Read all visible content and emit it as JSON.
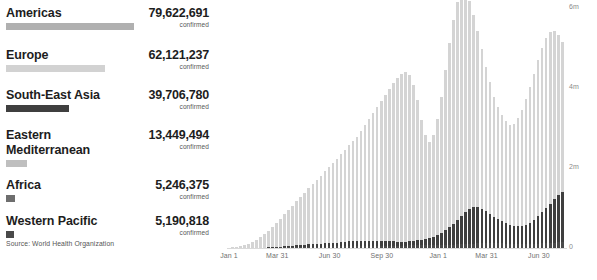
{
  "legend": {
    "confirmed_label": "confirmed",
    "items": [
      {
        "name": "Americas",
        "value": "79,622,691",
        "bar_width": 128,
        "color": "#b0b0b0",
        "swatch": "bar"
      },
      {
        "name": "Europe",
        "value": "62,121,237",
        "bar_width": 99,
        "color": "#d2d2d2",
        "swatch": "bar"
      },
      {
        "name": "South-East Asia",
        "value": "39,706,780",
        "bar_width": 63,
        "color": "#3f3f3f",
        "swatch": "bar"
      },
      {
        "name": "Eastern Mediterranean",
        "value": "13,449,494",
        "bar_width": 21,
        "color": "#bfbfbf",
        "swatch": "bar"
      },
      {
        "name": "Africa",
        "value": "5,246,375",
        "bar_width": 9,
        "color": "#6e6e6e",
        "swatch": "square"
      },
      {
        "name": "Western Pacific",
        "value": "5,190,818",
        "bar_width": 8,
        "color": "#4a4a4a",
        "swatch": "square"
      }
    ]
  },
  "source": "Source: World Health Organization",
  "chart_data": {
    "type": "bar",
    "stacked": true,
    "title": "",
    "xlabel": "",
    "ylabel": "",
    "ylim": [
      0,
      6000000
    ],
    "grid": false,
    "legend_position": "left-panel",
    "ytick_labels": [
      "6m",
      "4m",
      "2m",
      "0"
    ],
    "ytick_values": [
      6000000,
      4000000,
      2000000,
      0
    ],
    "xtick_labels": [
      "Jan 1",
      "Mar 31",
      "Jun 30",
      "Sep 30",
      "Jan 1",
      "Mar 31",
      "Jun 30"
    ],
    "xtick_indices": [
      0,
      12,
      25,
      38,
      52,
      64,
      77
    ],
    "series": [
      {
        "name": "bottom-dark",
        "color": "#4a4a4a",
        "values": [
          0,
          0,
          0,
          0,
          0,
          0,
          0,
          2,
          4,
          6,
          8,
          10,
          12,
          14,
          16,
          18,
          20,
          22,
          24,
          26,
          28,
          30,
          32,
          34,
          36,
          38,
          40,
          42,
          44,
          46,
          48,
          48,
          48,
          46,
          46,
          46,
          46,
          48,
          50,
          52,
          54,
          56,
          58,
          60,
          62,
          64,
          66,
          68,
          70,
          72,
          74,
          76,
          78,
          80,
          82,
          84,
          86,
          90,
          95,
          100,
          105,
          110,
          115,
          120,
          125,
          130,
          128,
          124,
          118,
          112,
          106,
          100,
          96,
          92,
          90,
          95,
          100,
          108,
          116,
          124,
          130,
          136,
          142,
          148
        ]
      },
      {
        "name": "mid-dark",
        "color": "#3f3f3f",
        "values": [
          0,
          0,
          0,
          0,
          0,
          0,
          0,
          0,
          2,
          4,
          8,
          12,
          16,
          22,
          28,
          34,
          40,
          46,
          52,
          58,
          62,
          66,
          70,
          74,
          78,
          84,
          90,
          96,
          104,
          112,
          120,
          128,
          136,
          140,
          142,
          140,
          136,
          130,
          124,
          118,
          112,
          108,
          104,
          100,
          98,
          100,
          108,
          120,
          136,
          156,
          180,
          210,
          250,
          300,
          360,
          430,
          510,
          600,
          700,
          800,
          870,
          910,
          900,
          860,
          800,
          730,
          660,
          600,
          550,
          510,
          480,
          460,
          450,
          460,
          490,
          540,
          610,
          690,
          780,
          880,
          980,
          1080,
          1180,
          1260
        ]
      },
      {
        "name": "top-light",
        "color": "#d4d4d4",
        "values": [
          10,
          20,
          35,
          55,
          80,
          110,
          150,
          200,
          260,
          330,
          410,
          500,
          600,
          700,
          800,
          900,
          1000,
          1100,
          1200,
          1300,
          1400,
          1500,
          1600,
          1700,
          1800,
          1900,
          2000,
          2100,
          2200,
          2300,
          2400,
          2500,
          2600,
          2750,
          2900,
          3050,
          3200,
          3350,
          3500,
          3650,
          3800,
          3950,
          4100,
          4200,
          4250,
          4150,
          3900,
          3500,
          3000,
          2600,
          2400,
          2550,
          2900,
          3400,
          4000,
          4600,
          5100,
          5450,
          5600,
          5500,
          5200,
          4800,
          4400,
          4000,
          3600,
          3300,
          3000,
          2800,
          2650,
          2550,
          2500,
          2550,
          2700,
          2900,
          3150,
          3400,
          3650,
          3900,
          4100,
          4250,
          4300,
          4200,
          4000,
          3750
        ]
      }
    ],
    "bar_count": 84
  }
}
